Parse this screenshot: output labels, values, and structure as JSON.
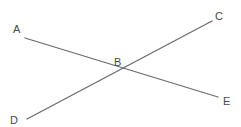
{
  "diagram": {
    "type": "intersecting-lines",
    "points": [
      {
        "id": "A",
        "label": "A",
        "x": 25,
        "y": 38,
        "label_x": 13,
        "label_y": 33
      },
      {
        "id": "B",
        "label": "B",
        "x": 122,
        "y": 68,
        "label_x": 114,
        "label_y": 66
      },
      {
        "id": "C",
        "label": "C",
        "x": 212,
        "y": 21,
        "label_x": 215,
        "label_y": 20
      },
      {
        "id": "D",
        "label": "D",
        "x": 27,
        "y": 119,
        "label_x": 10,
        "label_y": 124
      },
      {
        "id": "E",
        "label": "E",
        "x": 218,
        "y": 97,
        "label_x": 223,
        "label_y": 105
      }
    ],
    "segments": [
      {
        "id": "AE",
        "from": "A",
        "to": "E",
        "through": "B"
      },
      {
        "id": "DC",
        "from": "D",
        "to": "C",
        "through": "B"
      }
    ],
    "labels": {
      "A": "A",
      "B": "B",
      "C": "C",
      "D": "D",
      "E": "E"
    },
    "colors": {
      "line": "#6b6b6b",
      "text": "#4a4a4a",
      "background": "#ffffff"
    }
  }
}
